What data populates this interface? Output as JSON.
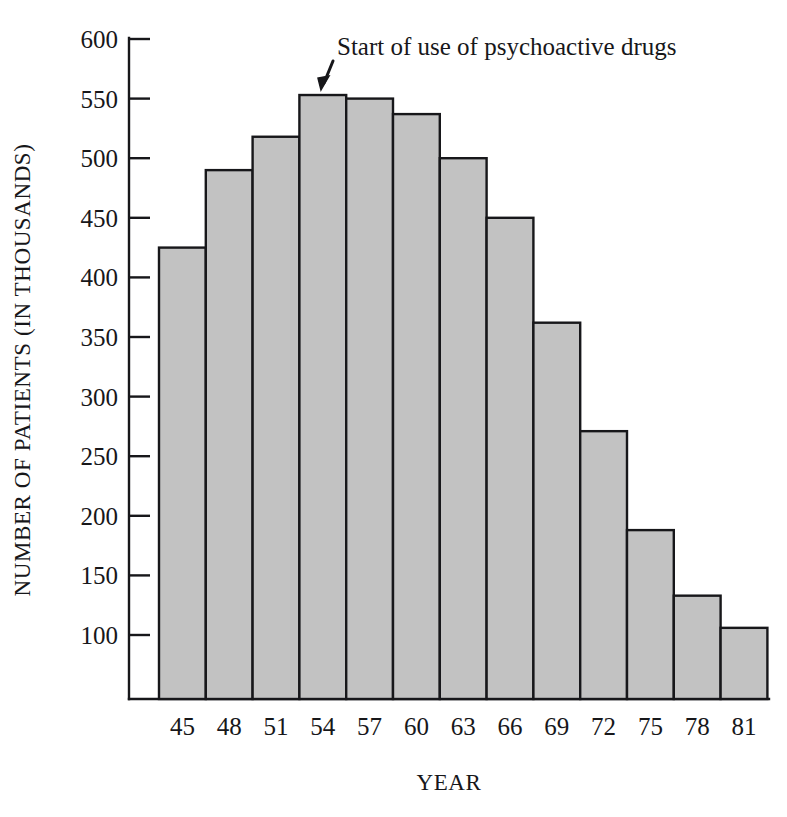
{
  "chart_data": {
    "type": "bar",
    "title": "",
    "xlabel": "YEAR",
    "ylabel": "NUMBER OF PATIENTS (IN THOUSANDS)",
    "categories": [
      "45",
      "48",
      "51",
      "54",
      "57",
      "60",
      "63",
      "66",
      "69",
      "72",
      "75",
      "78",
      "81"
    ],
    "values": [
      425,
      490,
      518,
      553,
      550,
      537,
      500,
      450,
      362,
      271,
      188,
      133,
      106
    ],
    "series": [
      {
        "name": "Number of patients",
        "values": [
          425,
          490,
          518,
          553,
          550,
          537,
          500,
          450,
          362,
          271,
          188,
          133,
          106
        ]
      }
    ],
    "ylim": [
      0,
      600
    ],
    "y_axis_min_drawn": 0,
    "y_ticks": [
      100,
      150,
      200,
      250,
      300,
      350,
      400,
      450,
      500,
      550,
      600
    ],
    "y_tick_labels": [
      "100",
      "150",
      "200",
      "250",
      "300",
      "350",
      "400",
      "450",
      "500",
      "550",
      "600"
    ],
    "grid": false,
    "legend": false,
    "legend_position": "none",
    "annotations": [
      {
        "text": "Start of use of psychoactive drugs",
        "points_to_category": "54",
        "arrow": "down-left"
      }
    ],
    "colors": {
      "bar_fill": "#c2c2c2",
      "bar_stroke": "#17171a",
      "axis": "#17171a",
      "background": "#ffffff",
      "text": "#17171a"
    }
  }
}
